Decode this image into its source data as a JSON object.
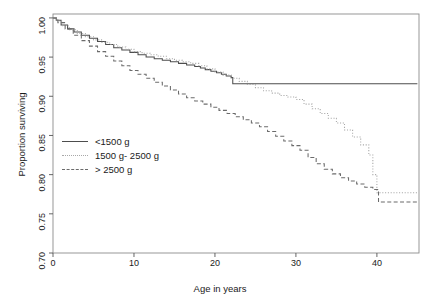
{
  "chart_data": {
    "type": "line",
    "title": "",
    "xlabel": "Age in years",
    "ylabel": "Proportion surviving",
    "xlim": [
      0,
      45.2
    ],
    "ylim": [
      0.7,
      1.005
    ],
    "xticks": [
      0,
      10,
      20,
      30,
      40
    ],
    "xtick_labels": [
      "0",
      "10",
      "20",
      "30",
      "40"
    ],
    "yticks": [
      0.7,
      0.75,
      0.8,
      0.85,
      0.9,
      0.95,
      1.0
    ],
    "ytick_labels": [
      "0.70",
      "0.75",
      "0.80",
      "0.85",
      "0.90",
      "0.95",
      "1.00"
    ],
    "grid": false,
    "legend_position": "center-left",
    "step_style": "kaplan-meier",
    "series": [
      {
        "name": "<1500 g",
        "style": "solid",
        "color": "#4d4d4d",
        "points": [
          [
            0,
            1.0
          ],
          [
            0.4,
            0.997
          ],
          [
            1.0,
            0.991
          ],
          [
            1.8,
            0.986
          ],
          [
            2.6,
            0.982
          ],
          [
            3.5,
            0.978
          ],
          [
            4.5,
            0.974
          ],
          [
            5.5,
            0.97
          ],
          [
            6.5,
            0.966
          ],
          [
            7.5,
            0.962
          ],
          [
            8.5,
            0.959
          ],
          [
            9.5,
            0.956
          ],
          [
            10.5,
            0.953
          ],
          [
            11.5,
            0.95
          ],
          [
            12.5,
            0.948
          ],
          [
            13.5,
            0.946
          ],
          [
            14.5,
            0.944
          ],
          [
            15.5,
            0.942
          ],
          [
            16.5,
            0.94
          ],
          [
            17.5,
            0.938
          ],
          [
            18.2,
            0.936
          ],
          [
            18.8,
            0.934
          ],
          [
            19.5,
            0.932
          ],
          [
            20.2,
            0.93
          ],
          [
            20.8,
            0.928
          ],
          [
            21.4,
            0.926
          ],
          [
            22.0,
            0.924
          ],
          [
            22.2,
            0.916
          ],
          [
            45.0,
            0.916
          ]
        ]
      },
      {
        "name": "1500 g- 2500 g",
        "style": "dotted",
        "color": "#a8a8a8",
        "points": [
          [
            0,
            1.0
          ],
          [
            0.5,
            0.996
          ],
          [
            1.2,
            0.99
          ],
          [
            2.0,
            0.985
          ],
          [
            3.0,
            0.98
          ],
          [
            4.0,
            0.976
          ],
          [
            5.0,
            0.972
          ],
          [
            6.0,
            0.969
          ],
          [
            7.0,
            0.966
          ],
          [
            8.0,
            0.963
          ],
          [
            9.0,
            0.96
          ],
          [
            10.0,
            0.957
          ],
          [
            11.0,
            0.955
          ],
          [
            12.0,
            0.953
          ],
          [
            13.0,
            0.951
          ],
          [
            14.0,
            0.948
          ],
          [
            15.0,
            0.946
          ],
          [
            16.0,
            0.944
          ],
          [
            17.0,
            0.942
          ],
          [
            18.0,
            0.939
          ],
          [
            19.0,
            0.935
          ],
          [
            20.0,
            0.931
          ],
          [
            21.0,
            0.927
          ],
          [
            22.0,
            0.923
          ],
          [
            23.0,
            0.919
          ],
          [
            24.0,
            0.915
          ],
          [
            25.0,
            0.911
          ],
          [
            26.0,
            0.907
          ],
          [
            27.0,
            0.904
          ],
          [
            28.0,
            0.901
          ],
          [
            29.0,
            0.899
          ],
          [
            30.0,
            0.896
          ],
          [
            31.0,
            0.89
          ],
          [
            32.0,
            0.884
          ],
          [
            33.0,
            0.878
          ],
          [
            34.0,
            0.872
          ],
          [
            35.0,
            0.866
          ],
          [
            36.0,
            0.857
          ],
          [
            37.0,
            0.848
          ],
          [
            38.0,
            0.838
          ],
          [
            39.0,
            0.825
          ],
          [
            39.5,
            0.8
          ],
          [
            40.0,
            0.777
          ],
          [
            45.0,
            0.777
          ]
        ]
      },
      {
        "name": "> 2500 g",
        "style": "dashed",
        "color": "#6b6b6b",
        "points": [
          [
            0,
            1.0
          ],
          [
            0.6,
            0.994
          ],
          [
            1.5,
            0.986
          ],
          [
            2.5,
            0.978
          ],
          [
            3.5,
            0.971
          ],
          [
            4.5,
            0.964
          ],
          [
            5.5,
            0.957
          ],
          [
            6.5,
            0.951
          ],
          [
            7.5,
            0.945
          ],
          [
            8.5,
            0.939
          ],
          [
            9.5,
            0.933
          ],
          [
            10.5,
            0.928
          ],
          [
            11.5,
            0.923
          ],
          [
            12.5,
            0.918
          ],
          [
            13.5,
            0.913
          ],
          [
            14.5,
            0.908
          ],
          [
            15.5,
            0.903
          ],
          [
            16.5,
            0.898
          ],
          [
            17.5,
            0.894
          ],
          [
            18.5,
            0.89
          ],
          [
            19.5,
            0.886
          ],
          [
            20.5,
            0.882
          ],
          [
            21.5,
            0.878
          ],
          [
            22.5,
            0.874
          ],
          [
            23.5,
            0.87
          ],
          [
            24.5,
            0.866
          ],
          [
            25.5,
            0.861
          ],
          [
            26.5,
            0.855
          ],
          [
            27.5,
            0.849
          ],
          [
            28.5,
            0.843
          ],
          [
            29.5,
            0.837
          ],
          [
            30.5,
            0.831
          ],
          [
            31.5,
            0.822
          ],
          [
            32.5,
            0.814
          ],
          [
            33.5,
            0.807
          ],
          [
            34.5,
            0.801
          ],
          [
            35.5,
            0.796
          ],
          [
            36.5,
            0.792
          ],
          [
            37.5,
            0.788
          ],
          [
            38.5,
            0.784
          ],
          [
            39.5,
            0.781
          ],
          [
            40.2,
            0.765
          ],
          [
            45.0,
            0.765
          ]
        ]
      }
    ]
  },
  "legend": {
    "items": [
      {
        "label": "<1500 g"
      },
      {
        "label": "1500 g- 2500 g"
      },
      {
        "label": "> 2500 g"
      }
    ]
  }
}
